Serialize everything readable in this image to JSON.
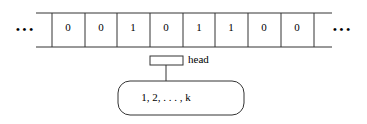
{
  "tape": {
    "cells": [
      "0",
      "0",
      "1",
      "0",
      "1",
      "1",
      "0",
      "0"
    ],
    "left_ellipsis": "• • •",
    "right_ellipsis": "• • •"
  },
  "head": {
    "label": "head"
  },
  "control": {
    "states": "1, 2, . . . , k"
  },
  "colors": {
    "stroke": "#333333",
    "background": "#ffffff"
  }
}
